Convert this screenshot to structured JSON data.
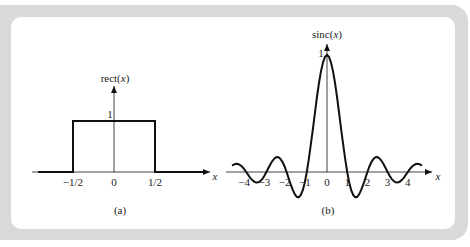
{
  "figure": {
    "panel_a": {
      "caption": "(a)",
      "y_label_fn": "rect(",
      "y_label_var": "x",
      "y_label_close": ")",
      "x_label": "x",
      "peak_label": "1",
      "ticks": [
        "−1/2",
        "0",
        "1/2"
      ]
    },
    "panel_b": {
      "caption": "(b)",
      "y_label_fn": "sinc(",
      "y_label_var": "x",
      "y_label_close": ")",
      "x_label": "x",
      "peak_label": "1",
      "ticks": [
        "−4",
        "−3",
        "−2",
        "−1",
        "0",
        "1",
        "2",
        "3",
        "4"
      ]
    }
  },
  "chart_data": [
    {
      "type": "line",
      "title": "rect(x)",
      "caption": "(a)",
      "xlabel": "x",
      "ylabel": "rect(x)",
      "x_ticks": [
        "-1/2",
        "0",
        "1/2"
      ],
      "y_ticks": [
        "1"
      ],
      "x": [
        -1.0,
        -0.5,
        -0.5,
        0.5,
        0.5,
        1.0
      ],
      "y": [
        0,
        0,
        1,
        1,
        0,
        0
      ],
      "grid": false
    },
    {
      "type": "line",
      "title": "sinc(x)",
      "caption": "(b)",
      "xlabel": "x",
      "ylabel": "sinc(x)",
      "x_ticks": [
        "-4",
        "-3",
        "-2",
        "-1",
        "0",
        "1",
        "2",
        "3",
        "4"
      ],
      "y_ticks": [
        "1"
      ],
      "xlim": [
        -4.7,
        4.7
      ],
      "ylim": [
        -0.22,
        1
      ],
      "x": [
        0,
        0.1,
        0.2,
        0.3,
        0.4,
        0.5,
        0.6,
        0.7,
        0.8,
        0.9,
        1.0,
        1.1,
        1.2,
        1.3,
        1.4,
        1.5,
        1.6,
        1.7,
        1.8,
        1.9,
        2.0,
        2.1,
        2.2,
        2.3,
        2.4,
        2.5,
        2.6,
        2.7,
        2.8,
        2.9,
        3.0,
        3.1,
        3.2,
        3.3,
        3.4,
        3.5,
        3.6,
        3.7,
        3.8,
        3.9,
        4.0,
        4.1,
        4.2,
        4.3,
        4.4,
        4.5,
        4.6,
        4.7
      ],
      "y": [
        1,
        0.9836,
        0.9355,
        0.8584,
        0.7568,
        0.6366,
        0.5046,
        0.3679,
        0.2339,
        0.1093,
        0,
        -0.0894,
        -0.1559,
        -0.1981,
        -0.2162,
        -0.2122,
        -0.1892,
        -0.1514,
        -0.1039,
        -0.0518,
        0,
        0.0468,
        0.085,
        0.112,
        0.1261,
        0.1273,
        0.1164,
        0.0953,
        0.0668,
        0.0339,
        0,
        -0.0317,
        -0.0585,
        -0.078,
        -0.089,
        -0.0909,
        -0.0841,
        -0.0695,
        -0.0492,
        -0.0252,
        0,
        0.024,
        0.0445,
        0.0598,
        0.0688,
        0.0707,
        0.0658,
        0.0544
      ],
      "symmetric": true,
      "grid": false
    }
  ]
}
